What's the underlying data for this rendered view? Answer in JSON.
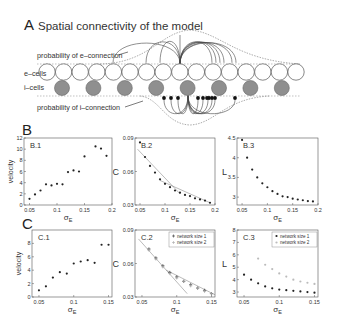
{
  "panel_a": {
    "letter": "A",
    "title": "Spatial connectivity of the model",
    "label_e_prob": "probability of e–connection",
    "label_i_prob": "probability of i–connection",
    "label_e_cells": "e–cells",
    "label_i_cells": "i–cells",
    "e_cell_count": 16,
    "i_cell_count": 8,
    "colors": {
      "e_cell_fill": "#ffffff",
      "i_cell_fill": "#8f8f8f",
      "stroke": "#555555"
    }
  },
  "panel_b": {
    "letter": "B"
  },
  "panel_c": {
    "letter": "C"
  },
  "chart_data": [
    {
      "id": "B.1",
      "type": "scatter",
      "title": "B.1",
      "xlabel": "σE",
      "ylabel": "velocity",
      "xlim": [
        0.04,
        0.2
      ],
      "ylim": [
        0,
        12
      ],
      "xticks": [
        "0.05",
        "0.1",
        "0.15",
        "0.2"
      ],
      "xtick_values": [
        0.05,
        0.1,
        0.15,
        0.2
      ],
      "yticks": [
        "0",
        "2",
        "4",
        "6",
        "8",
        "10",
        "12"
      ],
      "ytick_values": [
        0,
        2,
        4,
        6,
        8,
        10,
        12
      ],
      "series": [
        {
          "name": "velocity",
          "marker": "dot",
          "x": [
            0.05,
            0.06,
            0.07,
            0.08,
            0.09,
            0.1,
            0.11,
            0.12,
            0.13,
            0.14,
            0.15,
            0.17,
            0.18,
            0.19
          ],
          "y": [
            1.1,
            1.9,
            2.6,
            3.7,
            3.5,
            3.8,
            3.7,
            5.9,
            6.2,
            6.0,
            8.7,
            10.5,
            10.1,
            8.8
          ]
        }
      ]
    },
    {
      "id": "B.2",
      "type": "scatter",
      "title": "B.2",
      "xlabel": "σE",
      "ylabel": "C",
      "xlim": [
        0.04,
        0.2
      ],
      "ylim": [
        0.03,
        0.09
      ],
      "xticks": [
        "0.05",
        "0.1",
        "0.15",
        "0.2"
      ],
      "xtick_values": [
        0.05,
        0.1,
        0.15,
        0.2
      ],
      "yticks": [
        "0.03",
        "0.06",
        "0.09"
      ],
      "ytick_values": [
        0.03,
        0.06,
        0.09
      ],
      "series": [
        {
          "name": "C",
          "marker": "dot",
          "x": [
            0.05,
            0.06,
            0.07,
            0.08,
            0.09,
            0.1,
            0.11,
            0.12,
            0.13,
            0.14,
            0.15,
            0.16,
            0.17,
            0.18,
            0.19
          ],
          "y": [
            0.086,
            0.073,
            0.065,
            0.059,
            0.053,
            0.049,
            0.046,
            0.043,
            0.041,
            0.039,
            0.038,
            0.036,
            0.035,
            0.034,
            0.032
          ]
        }
      ],
      "fit_lines": [
        {
          "x": [
            0.045,
            0.13
          ],
          "y": [
            0.08,
            0.04
          ]
        },
        {
          "x": [
            0.09,
            0.19
          ],
          "y": [
            0.052,
            0.032
          ]
        }
      ]
    },
    {
      "id": "B.3",
      "type": "scatter",
      "title": "B.3",
      "xlabel": "σE",
      "ylabel": "L",
      "xlim": [
        0.04,
        0.2
      ],
      "ylim": [
        2.8,
        4.5
      ],
      "xticks": [
        "0.05",
        "0.1",
        "0.15",
        "0.2"
      ],
      "xtick_values": [
        0.05,
        0.1,
        0.15,
        0.2
      ],
      "yticks": [
        "3",
        "3.5",
        "4",
        "4.5"
      ],
      "ytick_values": [
        3,
        3.5,
        4,
        4.5
      ],
      "series": [
        {
          "name": "L",
          "marker": "dot",
          "x": [
            0.05,
            0.06,
            0.07,
            0.08,
            0.09,
            0.1,
            0.11,
            0.12,
            0.13,
            0.14,
            0.15,
            0.16,
            0.17,
            0.18,
            0.19
          ],
          "y": [
            4.45,
            4.0,
            3.7,
            3.5,
            3.35,
            3.25,
            3.15,
            3.08,
            3.02,
            3.0,
            2.96,
            2.94,
            2.92,
            2.9,
            2.89
          ]
        }
      ]
    },
    {
      "id": "C.1",
      "type": "scatter",
      "title": "C.1",
      "xlabel": "σE",
      "ylabel": "velocity",
      "xlim": [
        0.04,
        0.155
      ],
      "ylim": [
        0,
        10
      ],
      "xticks": [
        "0.05",
        "0.1",
        "0.15"
      ],
      "xtick_values": [
        0.05,
        0.1,
        0.15
      ],
      "yticks": [
        "0",
        "2",
        "4",
        "6",
        "8"
      ],
      "ytick_values": [
        0,
        2,
        4,
        6,
        8
      ],
      "series": [
        {
          "name": "velocity",
          "marker": "dot",
          "x": [
            0.05,
            0.06,
            0.07,
            0.08,
            0.09,
            0.1,
            0.11,
            0.12,
            0.13,
            0.14,
            0.15
          ],
          "y": [
            1.0,
            1.6,
            2.9,
            3.7,
            3.5,
            5.0,
            5.3,
            5.5,
            5.1,
            7.8,
            7.8
          ]
        }
      ]
    },
    {
      "id": "C.2",
      "type": "scatter",
      "title": "C.2",
      "xlabel": "σE",
      "ylabel": "C",
      "xlim": [
        0.04,
        0.155
      ],
      "ylim": [
        0.03,
        0.09
      ],
      "xticks": [
        "0.05",
        "0.1",
        "0.15"
      ],
      "xtick_values": [
        0.05,
        0.1,
        0.15
      ],
      "yticks": [
        "0.03",
        "0.06",
        "0.09"
      ],
      "ytick_values": [
        0.03,
        0.06,
        0.09
      ],
      "legend": [
        "network size 1",
        "network size 2"
      ],
      "legend_position": "upper right",
      "series": [
        {
          "name": "network size 1",
          "marker": "plus",
          "color": "#333333",
          "x": [
            0.06,
            0.07,
            0.08,
            0.09,
            0.1,
            0.11,
            0.12,
            0.13,
            0.14,
            0.15
          ],
          "y": [
            0.073,
            0.065,
            0.058,
            0.052,
            0.048,
            0.044,
            0.041,
            0.038,
            0.036,
            0.033
          ]
        },
        {
          "name": "network size 2",
          "marker": "plus",
          "color": "#aaaaaa",
          "x": [
            0.06,
            0.07,
            0.08,
            0.09,
            0.1,
            0.11,
            0.12,
            0.13,
            0.14,
            0.15
          ],
          "y": [
            0.072,
            0.064,
            0.057,
            0.051,
            0.047,
            0.044,
            0.04,
            0.038,
            0.035,
            0.033
          ]
        }
      ],
      "fit_lines": [
        {
          "x": [
            0.045,
            0.115
          ],
          "y": [
            0.082,
            0.033
          ]
        },
        {
          "x": [
            0.085,
            0.155
          ],
          "y": [
            0.054,
            0.032
          ]
        }
      ]
    },
    {
      "id": "C.3",
      "type": "scatter",
      "title": "C.3",
      "xlabel": "σE",
      "ylabel": "L",
      "xlim": [
        0.04,
        0.155
      ],
      "ylim": [
        2.6,
        8
      ],
      "xticks": [
        "0.05",
        "0.1",
        "0.15"
      ],
      "xtick_values": [
        0.05,
        0.1,
        0.15
      ],
      "yticks": [
        "3",
        "4",
        "5",
        "6",
        "7",
        "8"
      ],
      "ytick_values": [
        3,
        4,
        5,
        6,
        7,
        8
      ],
      "legend": [
        "network size 1",
        "network size 2"
      ],
      "legend_position": "upper right",
      "series": [
        {
          "name": "network size 1",
          "marker": "dot",
          "color": "#222222",
          "x": [
            0.05,
            0.06,
            0.07,
            0.08,
            0.09,
            0.1,
            0.11,
            0.12,
            0.13,
            0.14,
            0.15
          ],
          "y": [
            4.4,
            4.0,
            3.7,
            3.45,
            3.3,
            3.2,
            3.15,
            3.1,
            3.05,
            3.0,
            2.95
          ]
        },
        {
          "name": "network size 2",
          "marker": "dot",
          "color": "#bbbbbb",
          "x": [
            0.07,
            0.08,
            0.09,
            0.1,
            0.11,
            0.12,
            0.13,
            0.14,
            0.15
          ],
          "y": [
            5.7,
            5.2,
            4.85,
            4.5,
            4.25,
            4.0,
            3.85,
            3.75,
            3.65
          ]
        }
      ]
    }
  ]
}
